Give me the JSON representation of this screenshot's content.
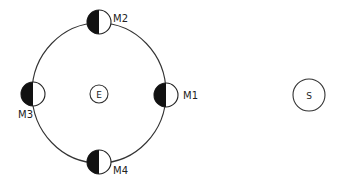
{
  "diagram": {
    "type": "moon-phases-orbit",
    "colors": {
      "line": "#333333",
      "dark": "#111111",
      "light": "#ffffff"
    },
    "earth": {
      "label": "E"
    },
    "sun": {
      "label": "S"
    },
    "moons": [
      {
        "id": "M1",
        "label": "M1",
        "position": "right"
      },
      {
        "id": "M2",
        "label": "M2",
        "position": "top"
      },
      {
        "id": "M3",
        "label": "M3",
        "position": "left"
      },
      {
        "id": "M4",
        "label": "M4",
        "position": "bottom"
      }
    ]
  }
}
